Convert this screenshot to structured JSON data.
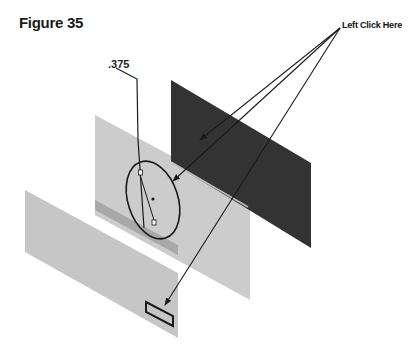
{
  "figure": {
    "title": "Figure 35",
    "callout_label": "Left Click Here",
    "dimension_label": ".375"
  },
  "colors": {
    "dark_plane": "#333333",
    "light_plane": "#c4c4c4",
    "light_plane_edge": "#a9a9a9",
    "line": "#1a1a1a"
  },
  "elements": {
    "planes": [
      "dark plane (back)",
      "light plane (middle)",
      "light plane (front)"
    ],
    "sketch": [
      "circle",
      "dimension line",
      "rectangle"
    ]
  }
}
